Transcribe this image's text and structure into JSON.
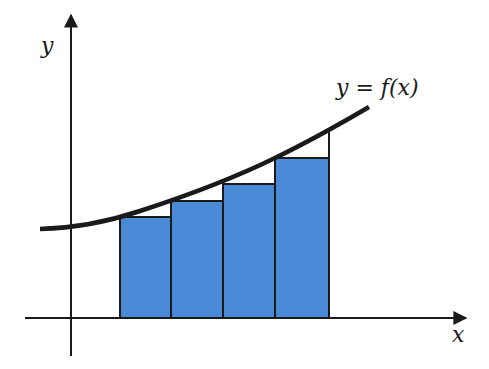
{
  "diagram": {
    "type": "riemann-sum-left-endpoint",
    "axes": {
      "x_label": "x",
      "y_label": "y"
    },
    "curve_label": "y = f(x)",
    "colors": {
      "bar_fill": "#4a89d6",
      "bar_stroke": "#1a1a1a",
      "curve": "#1a1a1a",
      "axis": "#1a1a1a",
      "background": "#ffffff"
    },
    "rectangles": [
      {
        "index": 1,
        "x0": 120,
        "x1": 171,
        "top": 217
      },
      {
        "index": 2,
        "x0": 171,
        "x1": 223,
        "top": 201
      },
      {
        "index": 3,
        "x0": 223,
        "x1": 275,
        "top": 184
      },
      {
        "index": 4,
        "x0": 275,
        "x1": 329,
        "top": 158
      }
    ],
    "right_boundary_x": 329,
    "rectangle_count": 4
  }
}
